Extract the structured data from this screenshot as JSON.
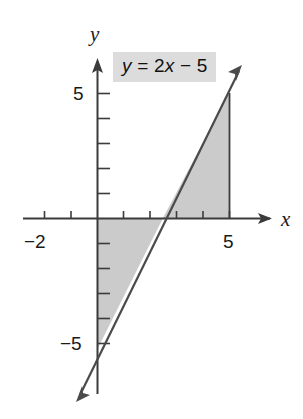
{
  "figure": {
    "equation_label": "y = 2x − 5",
    "x_axis_label": "x",
    "y_axis_label": "y",
    "x_tick_labels": [
      {
        "value": -2,
        "text": "−2"
      },
      {
        "value": 5,
        "text": "5"
      }
    ],
    "y_tick_labels": [
      {
        "value": 5,
        "text": "5"
      },
      {
        "value": -5,
        "text": "−5"
      }
    ],
    "colors": {
      "line": "#3b3b3b",
      "axis": "#3b3b3b",
      "shading": "#cccccc",
      "label_background": "#dcdcdc",
      "text": "#1a1a1a",
      "background": "#ffffff"
    }
  },
  "chart_data": {
    "type": "line",
    "title": "y = 2x − 5",
    "xlabel": "x",
    "ylabel": "y",
    "xlim": [
      -2.9,
      6.6
    ],
    "ylim": [
      -7.5,
      6.1
    ],
    "grid": false,
    "legend": "none",
    "series": [
      {
        "name": "y = 2x − 5",
        "equation": "y = 2x - 5",
        "slope": 2,
        "intercept": -5,
        "x": [
          -0.7,
          5.8
        ],
        "y": [
          -6.4,
          6.6
        ],
        "arrow_both_ends": true
      }
    ],
    "x_ticks": [
      -2,
      -1,
      1,
      2,
      3,
      4,
      5
    ],
    "y_ticks": [
      5,
      4,
      3,
      2,
      1,
      -1,
      -2,
      -3,
      -4,
      -5
    ],
    "x_tick_labels_shown": [
      -2,
      5
    ],
    "y_tick_labels_shown": [
      5,
      -5
    ],
    "annotations": [
      {
        "text": "y = 2x − 5",
        "x": 0.8,
        "y": 5.4,
        "style": "gray-box"
      }
    ],
    "shaded_regions": [
      {
        "name": "region-below-axis",
        "description": "Triangle bounded by the y-axis, the x-axis and the line, for 0 ≤ x ≤ 2.5",
        "vertices": [
          [
            0,
            0
          ],
          [
            2.5,
            0
          ],
          [
            0,
            -5
          ]
        ],
        "fill": "#cccccc"
      },
      {
        "name": "region-above-axis",
        "description": "Triangle bounded by the x-axis, the line and the vertical segment x = 5, for 2.5 ≤ x ≤ 5",
        "vertices": [
          [
            2.5,
            0
          ],
          [
            5,
            0
          ],
          [
            5,
            5
          ]
        ],
        "fill": "#cccccc"
      }
    ],
    "vertical_boundary": {
      "x": 5,
      "y_from": 0,
      "y_to": 5
    },
    "x_intercept": 2.5,
    "y_intercept": -5
  }
}
